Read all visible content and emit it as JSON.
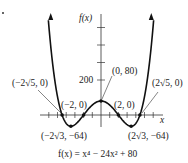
{
  "chart_data": {
    "type": "line",
    "title": "",
    "function_label": "f(x) = x⁴ − 24x² + 80",
    "xlabel": "x",
    "ylabel": "f(x)",
    "xlim": [
      -6.5,
      6.5
    ],
    "ylim": [
      -100,
      660
    ],
    "grid": false,
    "y_tick_labels": [
      {
        "value": 200,
        "label": "200"
      }
    ],
    "y_ticks": [
      200,
      300,
      400,
      500
    ],
    "x_ticks": [
      -6,
      -5,
      -4,
      -3,
      -2,
      -1,
      1,
      2,
      3,
      4,
      5,
      6
    ],
    "series": [
      {
        "name": "f(x) = x^4 - 24x^2 + 80",
        "formula": "x^4 - 24x^2 + 80"
      }
    ],
    "annotations": [
      {
        "label": "(−2√5, 0)",
        "x": -4.472,
        "y": 0
      },
      {
        "label": "(−2, 0)",
        "x": -2,
        "y": 0
      },
      {
        "label": "(0, 80)",
        "x": 0,
        "y": 80
      },
      {
        "label": "(2, 0)",
        "x": 2,
        "y": 0
      },
      {
        "label": "(2√5, 0)",
        "x": 4.472,
        "y": 0
      },
      {
        "label": "(−2√3, −64)",
        "x": -3.464,
        "y": -64
      },
      {
        "label": "(2√3, −64)",
        "x": 3.464,
        "y": -64
      }
    ]
  },
  "labels": {
    "y_axis": "f(x)",
    "x_axis": "x",
    "tick_200": "200",
    "pt_neg2root5": "(−2√5, 0)",
    "pt_neg2": "(−2, 0)",
    "pt_0_80": "(0, 80)",
    "pt_2": "(2, 0)",
    "pt_2root5": "(2√5, 0)",
    "pt_min_left": "(−2√3, −64)",
    "pt_min_right": "(2√3, −64)",
    "equation": "f(x) = x⁴ − 24x² + 80"
  }
}
